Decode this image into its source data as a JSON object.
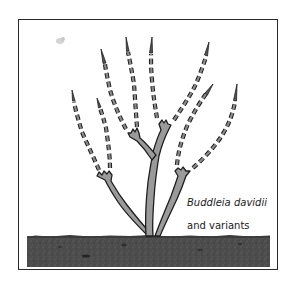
{
  "figure": {
    "type": "pruning-illustration",
    "caption": {
      "species": "Buddleia davidii",
      "qualifier": "and variants"
    },
    "colors": {
      "frame": "#2a2a2a",
      "stem_fill": "#9a9a9a",
      "stem_outline": "#1e1e1e",
      "shoot_fill": "#8a8a8a",
      "soil": "#4a4a4a",
      "background": "#ffffff"
    },
    "elements": {
      "pruned_stems": 4,
      "new_growth_shoots": 8,
      "soil_band": true
    }
  }
}
